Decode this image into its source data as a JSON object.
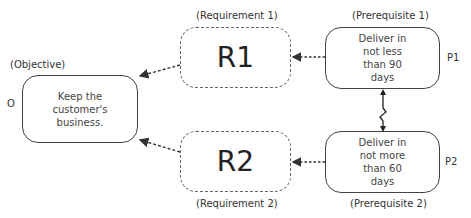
{
  "objective": {
    "tag": "O",
    "caption": "(Objective)",
    "text": "Keep the customer's business."
  },
  "requirements": [
    {
      "id": "R1",
      "caption": "(Requirement 1)"
    },
    {
      "id": "R2",
      "caption": "(Requirement 2)"
    }
  ],
  "prerequisites": [
    {
      "tag": "P1",
      "caption": "(Prerequisite 1)",
      "text": "Deliver in not less than 90 days"
    },
    {
      "tag": "P2",
      "caption": "(Prerequisite 2)",
      "text": "Deliver in not more than 60 days"
    }
  ],
  "conflict": {
    "icon": "conflict-zigzag-arrow"
  }
}
